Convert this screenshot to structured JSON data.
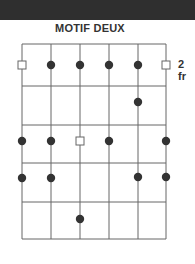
{
  "title": "MOTIF DEUX",
  "fret_label": "2 fr",
  "colors": {
    "topbar": "#2f2f2f",
    "line": "#666666",
    "dot": "#333333",
    "text": "#333333"
  },
  "diagram": {
    "strings_x": [
      22,
      51,
      80,
      109,
      138,
      166
    ],
    "frets_y": [
      44,
      86,
      125,
      163,
      202,
      239
    ],
    "markers": [
      {
        "type": "square",
        "string": 1,
        "y": 65
      },
      {
        "type": "dot",
        "string": 2,
        "y": 65
      },
      {
        "type": "dot",
        "string": 3,
        "y": 65
      },
      {
        "type": "dot",
        "string": 4,
        "y": 65
      },
      {
        "type": "dot",
        "string": 5,
        "y": 65
      },
      {
        "type": "square",
        "string": 6,
        "y": 65
      },
      {
        "type": "dot",
        "string": 5,
        "y": 102
      },
      {
        "type": "dot",
        "string": 1,
        "y": 141
      },
      {
        "type": "dot",
        "string": 2,
        "y": 141
      },
      {
        "type": "square",
        "string": 3,
        "y": 141
      },
      {
        "type": "dot",
        "string": 4,
        "y": 141
      },
      {
        "type": "dot",
        "string": 6,
        "y": 141
      },
      {
        "type": "dot",
        "string": 1,
        "y": 178
      },
      {
        "type": "dot",
        "string": 2,
        "y": 178
      },
      {
        "type": "dot",
        "string": 5,
        "y": 177
      },
      {
        "type": "dot",
        "string": 6,
        "y": 177
      },
      {
        "type": "dot",
        "string": 3,
        "y": 219
      }
    ]
  }
}
